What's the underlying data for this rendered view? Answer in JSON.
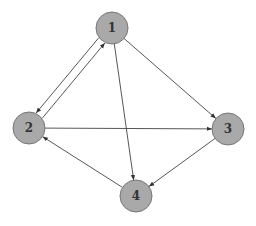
{
  "graph": {
    "type": "directed",
    "node_color": "#a9a9a9",
    "edge_color": "#444444",
    "nodes": [
      {
        "id": "1",
        "label": "1",
        "x": 112,
        "y": 28
      },
      {
        "id": "2",
        "label": "2",
        "x": 29,
        "y": 128
      },
      {
        "id": "3",
        "label": "3",
        "x": 228,
        "y": 129
      },
      {
        "id": "4",
        "label": "4",
        "x": 136,
        "y": 196
      }
    ],
    "edges": [
      {
        "from": "2",
        "to": "1"
      },
      {
        "from": "1",
        "to": "2"
      },
      {
        "from": "1",
        "to": "3"
      },
      {
        "from": "1",
        "to": "4"
      },
      {
        "from": "2",
        "to": "3"
      },
      {
        "from": "3",
        "to": "4"
      },
      {
        "from": "4",
        "to": "2"
      }
    ]
  }
}
